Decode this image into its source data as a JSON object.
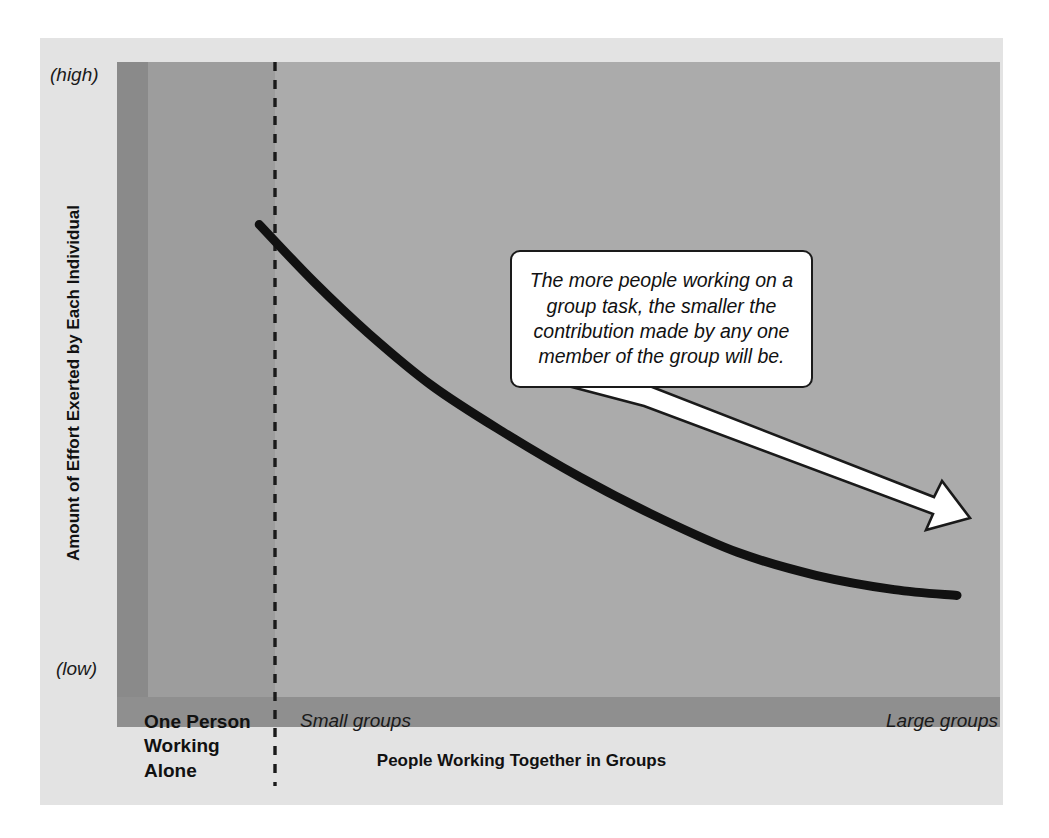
{
  "chart_data": {
    "type": "line",
    "title": "",
    "subtitle": "",
    "xlabel": "People Working Together in Groups",
    "ylabel": "Amount of Effort Exerted by Each Individual",
    "y_axis_ticks": [
      "(high)",
      "(low)"
    ],
    "x_axis_categories": [
      "One Person Working Alone",
      "Small groups",
      "Large groups"
    ],
    "ylim_labels": [
      "low",
      "high"
    ],
    "grid": false,
    "legend": "none",
    "series": [
      {
        "name": "Effort per individual",
        "description": "Exponentially decaying effort as group size increases",
        "points": [
          {
            "x": 0.11,
            "y": 0.78
          },
          {
            "x": 0.18,
            "y": 0.68
          },
          {
            "x": 0.25,
            "y": 0.59
          },
          {
            "x": 0.33,
            "y": 0.5
          },
          {
            "x": 0.42,
            "y": 0.42
          },
          {
            "x": 0.52,
            "y": 0.34
          },
          {
            "x": 0.62,
            "y": 0.27
          },
          {
            "x": 0.72,
            "y": 0.21
          },
          {
            "x": 0.82,
            "y": 0.17
          },
          {
            "x": 0.92,
            "y": 0.145
          },
          {
            "x": 1.0,
            "y": 0.135
          }
        ]
      }
    ],
    "annotations": [
      {
        "type": "callout",
        "text": "The more people working on a group task, the smaller the contribution made by any one member of the group will be."
      },
      {
        "type": "divider",
        "style": "dashed-vertical",
        "label": "boundary between one person working alone and small groups"
      },
      {
        "type": "arrow",
        "direction": "down-right",
        "style": "white-filled-outlined"
      }
    ],
    "colors": {
      "figure_background": "#e3e3e3",
      "band_dark": "#8a8a8a",
      "band_mid": "#9d9d9d",
      "band_light": "#ababab",
      "band_floor": "#8f8f8f",
      "curve": "#111111",
      "callout_fill": "#ffffff",
      "callout_border": "#1a1a1a",
      "text": "#111111"
    }
  },
  "axes": {
    "y_high_label": "(high)",
    "y_low_label": "(low)",
    "y_title": "Amount of Effort Exerted by Each Individual",
    "x_title": "People Working Together in Groups"
  },
  "categories": {
    "one_person": "One Person\nWorking\nAlone",
    "one_person_line1": "One Person",
    "one_person_line2": "Working",
    "one_person_line3": "Alone",
    "small_groups": "Small groups",
    "large_groups": "Large groups"
  },
  "callout": {
    "text": "The more people working on a group task, the smaller the contribution made by any one member of the group will be."
  }
}
